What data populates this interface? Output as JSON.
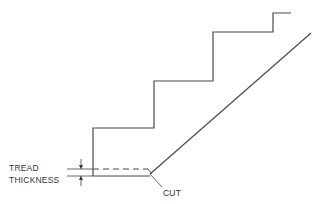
{
  "diagram": {
    "labels": {
      "tread_line1": "TREAD",
      "tread_line2": "THICKNESS",
      "cut": "CUT"
    },
    "steps_count": 4
  }
}
